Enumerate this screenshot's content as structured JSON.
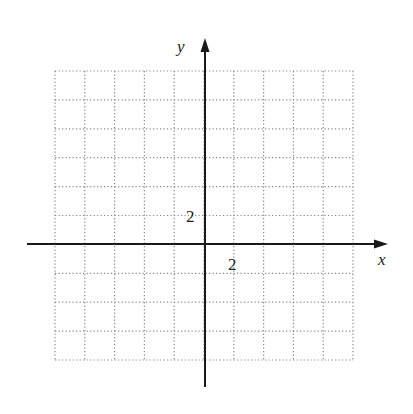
{
  "diagram": {
    "type": "coordinate-grid",
    "background": "#ffffff",
    "grid": {
      "left": 55,
      "right": 353,
      "top": 71,
      "bottom": 360,
      "columns": 10,
      "rows": 10,
      "line_color": "#888888",
      "line_style": "dotted"
    },
    "origin": {
      "x": 205,
      "y": 244
    },
    "axes": {
      "color": "#1a1a1a",
      "x_axis": {
        "label": "x",
        "from": 27,
        "to": 388
      },
      "y_axis": {
        "label": "y",
        "from": 387,
        "to": 38
      }
    },
    "tick_labels": {
      "x_scale": "2",
      "y_scale": "2"
    },
    "scale": {
      "units_per_cell": 2
    }
  }
}
